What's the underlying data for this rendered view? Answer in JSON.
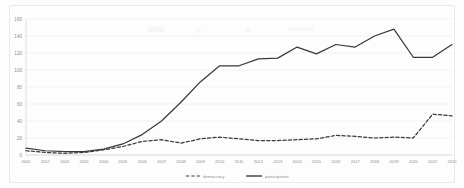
{
  "chart_data": {
    "type": "line",
    "title": "",
    "xlabel": "",
    "ylabel": "",
    "ylim": [
      0,
      160
    ],
    "ytick_step": 20,
    "grid": true,
    "legend_position": "bottom",
    "categories": [
      "2000",
      "2001",
      "2002",
      "2003",
      "2004",
      "2005",
      "2006",
      "2007",
      "2008",
      "2009",
      "2010",
      "2011",
      "2012",
      "2013",
      "2014",
      "2015",
      "2016",
      "2017",
      "2018",
      "2019",
      "2020",
      "2021",
      "2022"
    ],
    "yticks": [
      0,
      20,
      40,
      60,
      80,
      100,
      120,
      140,
      160
    ],
    "series": [
      {
        "name": "democracy",
        "style": "dashed",
        "color": "#3a3a3a",
        "values": [
          5,
          3,
          2,
          3,
          6,
          10,
          16,
          18,
          14,
          19,
          21,
          19,
          17,
          17,
          18,
          19,
          23,
          22,
          20,
          21,
          20,
          48,
          46
        ]
      },
      {
        "name": "participation",
        "style": "solid",
        "color": "#3a3a3a",
        "values": [
          8,
          5,
          4,
          4,
          7,
          13,
          24,
          40,
          62,
          86,
          105,
          105,
          113,
          114,
          127,
          119,
          130,
          127,
          140,
          148,
          115,
          115,
          130
        ]
      }
    ]
  },
  "legend": {
    "items": [
      {
        "label": "democracy",
        "style": "dashed"
      },
      {
        "label": "participation",
        "style": "solid"
      }
    ]
  },
  "axes": {
    "y_labels": [
      "160",
      "140",
      "120",
      "100",
      "80",
      "60",
      "40",
      "20",
      "0"
    ]
  }
}
